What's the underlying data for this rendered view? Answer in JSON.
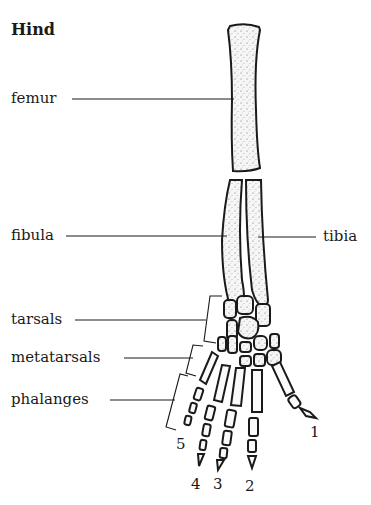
{
  "title": "Hind",
  "labels": {
    "femur": "femur",
    "fibula": "fibula",
    "tibia": "tibia",
    "tarsals": "tarsals",
    "metatarsals": "metatarsals",
    "phalanges": "phalanges"
  },
  "digits": [
    "1",
    "2",
    "3",
    "4",
    "5"
  ],
  "colors": {
    "ink": "#1a1a1a",
    "bone_fill": "#f4f4f4",
    "background": "#ffffff"
  }
}
